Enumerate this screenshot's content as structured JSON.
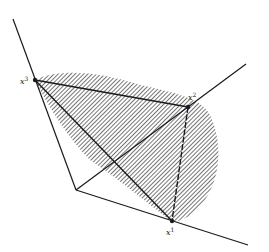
{
  "figure": {
    "colors": {
      "line": "#1a1a1a",
      "hatch": "#3a3a3a",
      "background": "#ffffff"
    },
    "vertices": [
      {
        "id": "x1",
        "base": "x",
        "superscript": "1"
      },
      {
        "id": "x2",
        "base": "x",
        "superscript": "2"
      },
      {
        "id": "x3",
        "base": "x",
        "superscript": "3"
      }
    ]
  }
}
